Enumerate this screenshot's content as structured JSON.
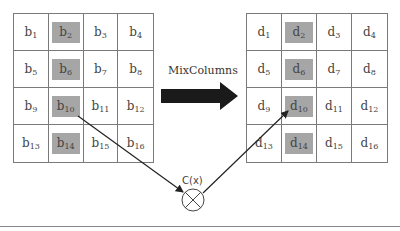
{
  "diagram": {
    "operation_label": "MixColumns",
    "function_label": "C(x)",
    "input_state": {
      "name": "b",
      "cells": [
        {
          "base": "b",
          "sub": "1",
          "highlighted": false
        },
        {
          "base": "b",
          "sub": "2",
          "highlighted": true
        },
        {
          "base": "b",
          "sub": "3",
          "highlighted": false
        },
        {
          "base": "b",
          "sub": "4",
          "highlighted": false
        },
        {
          "base": "b",
          "sub": "5",
          "highlighted": false
        },
        {
          "base": "b",
          "sub": "6",
          "highlighted": true
        },
        {
          "base": "b",
          "sub": "7",
          "highlighted": false
        },
        {
          "base": "b",
          "sub": "8",
          "highlighted": false
        },
        {
          "base": "b",
          "sub": "9",
          "highlighted": false
        },
        {
          "base": "b",
          "sub": "10",
          "highlighted": true
        },
        {
          "base": "b",
          "sub": "11",
          "highlighted": false
        },
        {
          "base": "b",
          "sub": "12",
          "highlighted": false
        },
        {
          "base": "b",
          "sub": "13",
          "highlighted": false
        },
        {
          "base": "b",
          "sub": "14",
          "highlighted": true
        },
        {
          "base": "b",
          "sub": "15",
          "highlighted": false
        },
        {
          "base": "b",
          "sub": "16",
          "highlighted": false
        }
      ]
    },
    "output_state": {
      "name": "d",
      "cells": [
        {
          "base": "d",
          "sub": "1",
          "highlighted": false
        },
        {
          "base": "d",
          "sub": "2",
          "highlighted": true
        },
        {
          "base": "d",
          "sub": "3",
          "highlighted": false
        },
        {
          "base": "d",
          "sub": "4",
          "highlighted": false
        },
        {
          "base": "d",
          "sub": "5",
          "highlighted": false
        },
        {
          "base": "d",
          "sub": "6",
          "highlighted": true
        },
        {
          "base": "d",
          "sub": "7",
          "highlighted": false
        },
        {
          "base": "d",
          "sub": "8",
          "highlighted": false
        },
        {
          "base": "d",
          "sub": "9",
          "highlighted": false
        },
        {
          "base": "d",
          "sub": "10",
          "highlighted": true
        },
        {
          "base": "d",
          "sub": "11",
          "highlighted": false
        },
        {
          "base": "d",
          "sub": "12",
          "highlighted": false
        },
        {
          "base": "d",
          "sub": "13",
          "highlighted": false
        },
        {
          "base": "d",
          "sub": "14",
          "highlighted": true
        },
        {
          "base": "d",
          "sub": "15",
          "highlighted": false
        },
        {
          "base": "d",
          "sub": "16",
          "highlighted": false
        }
      ]
    },
    "connections": [
      {
        "from": "b10",
        "to": "C(x)"
      },
      {
        "from": "C(x)",
        "to": "d10"
      }
    ],
    "colors": {
      "highlight": "#a6a6a6",
      "arrow": "#222222",
      "grid_line": "#7a7a7a"
    }
  }
}
